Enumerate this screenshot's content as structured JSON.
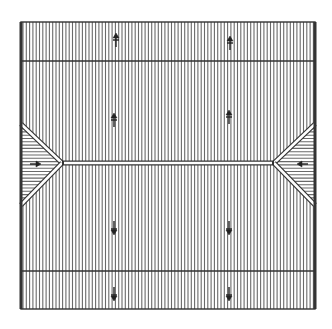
{
  "diagram": {
    "type": "roof-plan",
    "canvas": {
      "width": 332,
      "height": 329,
      "background": "#ffffff"
    },
    "ink_color": "#333333",
    "hatch_color": "#6a6a6a",
    "outline": {
      "x1": 21,
      "y1": 22,
      "x2": 315,
      "y2": 309
    },
    "course_lines_y": [
      61,
      271
    ],
    "ridge": {
      "y": 163,
      "x_left": 62,
      "x_right": 274
    },
    "hatch_spacing": 3.3,
    "arrows": [
      {
        "x": 116,
        "y": 37,
        "dir": "up"
      },
      {
        "x": 230,
        "y": 40,
        "dir": "up"
      },
      {
        "x": 114,
        "y": 117,
        "dir": "up"
      },
      {
        "x": 229,
        "y": 114,
        "dir": "up"
      },
      {
        "x": 33,
        "y": 164,
        "dir": "right"
      },
      {
        "x": 305,
        "y": 164,
        "dir": "left"
      },
      {
        "x": 114,
        "y": 226,
        "dir": "down"
      },
      {
        "x": 229,
        "y": 226,
        "dir": "down"
      },
      {
        "x": 114,
        "y": 292,
        "dir": "down"
      },
      {
        "x": 229,
        "y": 292,
        "dir": "down"
      }
    ],
    "caption": "Roof plan with hip ends and slope arrows"
  }
}
